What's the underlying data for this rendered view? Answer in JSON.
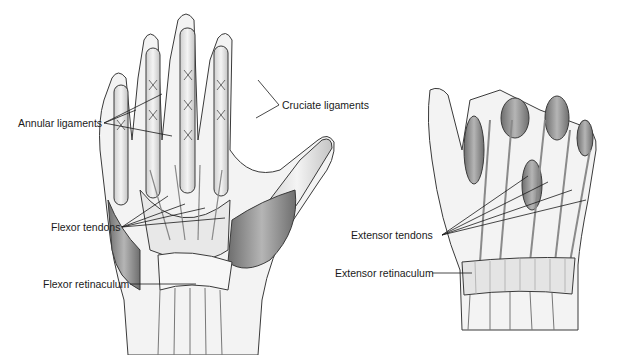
{
  "diagram": {
    "type": "anatomical-illustration",
    "views": [
      {
        "id": "palmar-view",
        "labels": [
          {
            "id": "annular",
            "text": "Annular ligaments"
          },
          {
            "id": "cruciate",
            "text": "Cruciate ligaments"
          },
          {
            "id": "flexor-tendons",
            "text": "Flexor tendons"
          },
          {
            "id": "flexor-retinaculum",
            "text": "Flexor retinaculum"
          }
        ]
      },
      {
        "id": "dorsal-view",
        "labels": [
          {
            "id": "extensor-tendons",
            "text": "Extensor tendons"
          },
          {
            "id": "extensor-retinaculum",
            "text": "Extensor retinaculum"
          }
        ]
      }
    ],
    "colors": {
      "outline": "#3a3a3a",
      "muscle_dark": "#7a7a7a",
      "muscle_mid": "#a8a8a8",
      "tendon_light": "#e6e6e6",
      "leader_line": "#1a1a1a"
    }
  }
}
